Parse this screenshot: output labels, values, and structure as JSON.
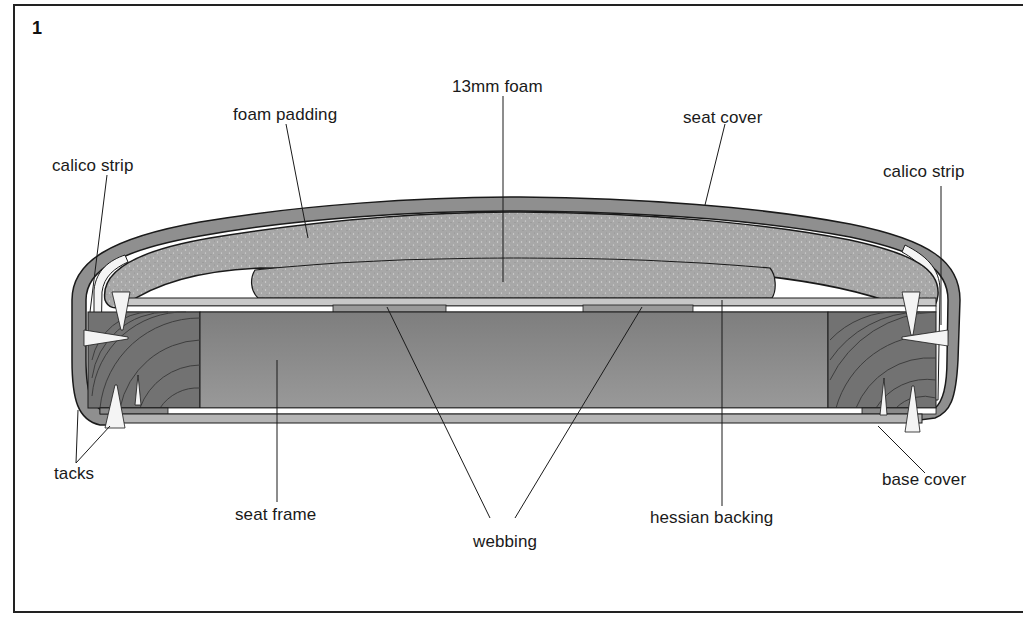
{
  "figure": {
    "number": "1",
    "labels": {
      "foam_13mm": "13mm foam",
      "foam_padding": "foam padding",
      "seat_cover": "seat cover",
      "calico_strip_left": "calico strip",
      "calico_strip_right": "calico strip",
      "tacks": "tacks",
      "seat_frame": "seat frame",
      "webbing": "webbing",
      "hessian_backing": "hessian backing",
      "base_cover": "base cover"
    }
  },
  "colors": {
    "foam": "#a9a9a9",
    "cover": "#8f8f8f",
    "frame_wood": "#858585",
    "frame_end_grain": "#6f6f6f",
    "webbing": "#9a9a9a",
    "outline": "#1a1a1a",
    "background": "#ffffff"
  }
}
